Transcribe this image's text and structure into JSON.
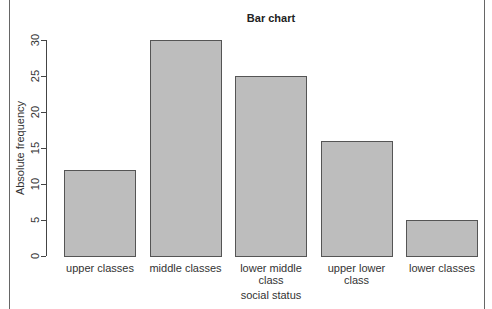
{
  "chart_data": {
    "type": "bar",
    "title": "Bar chart",
    "xlabel": "social status",
    "ylabel": "Absolute frequency",
    "categories": [
      "upper classes",
      "middle classes",
      "lower middle class",
      "upper lower class",
      "lower classes"
    ],
    "category_lines": [
      [
        "upper classes"
      ],
      [
        "middle classes"
      ],
      [
        "lower middle",
        "class"
      ],
      [
        "upper lower",
        "class"
      ],
      [
        "lower classes"
      ]
    ],
    "values": [
      12,
      30,
      25,
      16,
      5
    ],
    "ylim": [
      0,
      30
    ],
    "yticks": [
      0,
      5,
      10,
      15,
      20,
      25,
      30
    ],
    "grid": false,
    "legend": null,
    "bar_color": "#bdbdbd",
    "bar_edge_color": "#555555"
  }
}
